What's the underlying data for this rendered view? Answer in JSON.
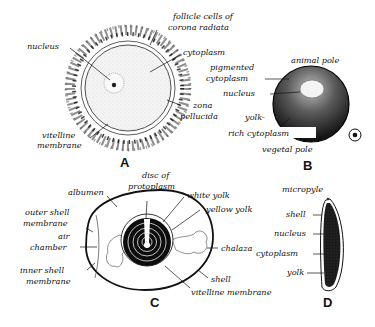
{
  "figure": {
    "panels": [
      {
        "id": "A",
        "letter": "A",
        "labels": {
          "follicle_1": "follicle cells of",
          "follicle_2": "corona radiata",
          "nucleus": "nucleus",
          "cytoplasm": "cytoplasm",
          "zona_1": "zona",
          "zona_2": "pellucida",
          "vitelline_1": "vitelline",
          "vitelline_2": "membrane"
        }
      },
      {
        "id": "B",
        "letter": "B",
        "labels": {
          "animal_pole": "animal pole",
          "pigmented_1": "pigmented",
          "pigmented_2": "cytoplasm",
          "nucleus": "nucleus",
          "yolk_1": "yolk-",
          "yolk_2": "rich cytoplasm",
          "vegetal_pole": "vegetal pole"
        },
        "symbol": "circled-dot-icon"
      },
      {
        "id": "C",
        "letter": "C",
        "labels": {
          "disc_1": "disc of",
          "disc_2": "protoplasm",
          "albumen": "albumen",
          "white_yolk": "white yolk",
          "yellow_yolk": "yellow yolk",
          "outer_1": "outer shell",
          "outer_2": "membrane",
          "air_1": "air",
          "air_2": "chamber",
          "chalaza": "chalaza",
          "inner_1": "inner shell",
          "inner_2": "membrane",
          "shell": "shell",
          "vitelline": "vitelline membrane"
        }
      },
      {
        "id": "D",
        "letter": "D",
        "labels": {
          "micropyle": "micropyle",
          "shell": "shell",
          "nucleus": "nucleus",
          "cytoplasm": "cytoplasm",
          "yolk": "yolk"
        }
      }
    ]
  }
}
